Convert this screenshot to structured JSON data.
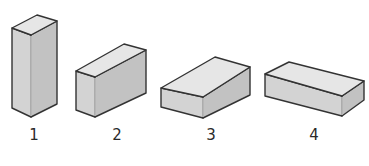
{
  "figure": {
    "colors": {
      "top_face": "#e6e6e6",
      "front_face": "#d3d3d3",
      "side_face": "#c2c2c2",
      "outline": "#333333",
      "highlight": "#f4f4f4"
    },
    "bricks": [
      {
        "label": "1",
        "orientation": "standing upright",
        "label_x": 34,
        "label_y": 135,
        "top": "12,28 37,15 57,21 31,35",
        "front": "12,28 31,35 31,117 12,108",
        "side": "31,35 57,21 57,104 31,117"
      },
      {
        "label": "2",
        "orientation": "lying on long side",
        "label_x": 117,
        "label_y": 135,
        "top": "76,71 124,44 146,50 95,77",
        "front": "76,71 95,77 95,117 76,110",
        "side": "95,77 146,50 146,93 95,117"
      },
      {
        "label": "3",
        "orientation": "lying flat, short end forward",
        "label_x": 211,
        "label_y": 135,
        "top": "161,88 215,57 250,67 203,97",
        "front": "161,88 203,97 203,118 161,107",
        "side": "203,97 250,67 250,95 203,118"
      },
      {
        "label": "4",
        "orientation": "lying flat, long side forward",
        "label_x": 314,
        "label_y": 135,
        "top": "265,74 289,62 364,81 342,96",
        "front": "265,74 342,96 342,116 265,96",
        "side": "342,96 364,81 364,100 342,116"
      }
    ]
  }
}
